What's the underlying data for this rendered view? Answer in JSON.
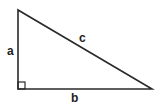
{
  "diagram": {
    "type": "right-triangle",
    "labels": {
      "leg_vertical": "a",
      "leg_horizontal": "b",
      "hypotenuse": "c"
    },
    "right_angle_marker": true,
    "colors": {
      "stroke": "#2a2a2a",
      "background": "#ffffff",
      "text": "#222222"
    }
  }
}
